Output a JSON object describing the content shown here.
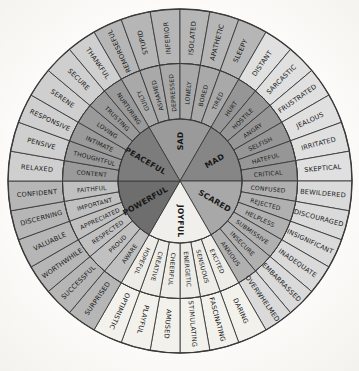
{
  "figure": {
    "name": "feeling-wheel",
    "background": "#fbfaf7"
  },
  "chart_data": {
    "type": "wheel-diagram",
    "rings": [
      "core",
      "middle",
      "outer"
    ],
    "start_angle_deg": -30,
    "section_span_deg": 60,
    "segment_span_deg": 10,
    "line_color": "#3a3a3a",
    "text_color": "#191919",
    "geometry": {
      "cx": 180,
      "cy": 181,
      "r_core": 62,
      "r_middle": 117.5,
      "r_outer": 172,
      "text_r_core": 40,
      "text_r_middle": 88.5,
      "text_r_outer": 143.5
    },
    "sections": [
      {
        "core": "SAD",
        "flip_text": false,
        "colors": {
          "core": "#9a9a9a",
          "middle": "#a9a9a9",
          "outer": "#b6b6b6"
        },
        "middle": [
          "GUILTY",
          "ASHAMED",
          "DEPRESSED",
          "LONELY",
          "BORED",
          "TIRED"
        ],
        "outer": [
          "REMORSEFUL",
          "STUPID",
          "INFERIOR",
          "ISOLATED",
          "APATHETIC",
          "SLEEPY"
        ]
      },
      {
        "core": "MAD",
        "flip_text": false,
        "colors": {
          "core": "#868686",
          "middle": "#969696",
          "outer": "#e0e0e0"
        },
        "middle": [
          "HURT",
          "HOSTILE",
          "ANGRY",
          "SELFISH",
          "HATEFUL",
          "CRITICAL"
        ],
        "outer": [
          "DISTANT",
          "SARCASTIC",
          "FRUSTRATED",
          "JEALOUS",
          "IRRITATED",
          "SKEPTICAL"
        ]
      },
      {
        "core": "SCARED",
        "flip_text": false,
        "colors": {
          "core": "#a8a8a8",
          "middle": "#b0b0b0",
          "outer": "#dadada"
        },
        "middle": [
          "CONFUSED",
          "REJECTED",
          "HELPLESS",
          "SUBMISSIVE",
          "INSECURE",
          "ANXIOUS"
        ],
        "outer": [
          "BEWILDERED",
          "DISCOURAGED",
          "INSIGNIFICANT",
          "INADEQUATE",
          "EMBARRASSED",
          "OVERWHELMED"
        ]
      },
      {
        "core": "JOYFUL",
        "flip_text": false,
        "colors": {
          "core": "#f0efeb",
          "middle": "#edece7",
          "outer": "#f2f1ec"
        },
        "middle": [
          "EXCITED",
          "SENSUOUS",
          "ENERGETIC",
          "CHEERFUL",
          "CREATIVE",
          "HOPEFUL"
        ],
        "outer": [
          "DARING",
          "FASCINATING",
          "STIMULATING",
          "AMUSED",
          "PLAYFUL",
          "OPTIMISTIC"
        ]
      },
      {
        "core": "POWERFUL",
        "flip_text": true,
        "colors": {
          "core": "#6e6e6e",
          "middle": "#c0c0c0",
          "outer": "#b6b6b6"
        },
        "middle": [
          "AWARE",
          "PROUD",
          "RESPECTED",
          "APPRECIATED",
          "IMPORTANT",
          "FAITHFUL"
        ],
        "outer": [
          "SURPRISED",
          "SUCCESSFUL",
          "WORTHWHILE",
          "VALUABLE",
          "DISCERNING",
          "CONFIDENT"
        ]
      },
      {
        "core": "PEACEFUL",
        "flip_text": true,
        "colors": {
          "core": "#7c7c7c",
          "middle": "#9a9a9a",
          "outer": "#cfcfcf"
        },
        "middle": [
          "CONTENT",
          "THOUGHTFUL",
          "INTIMATE",
          "LOVING",
          "TRUSTING",
          "NURTURING"
        ],
        "outer": [
          "RELAXED",
          "PENSIVE",
          "RESPONSIVE",
          "SERENE",
          "SECURE",
          "THANKFUL"
        ]
      }
    ]
  }
}
